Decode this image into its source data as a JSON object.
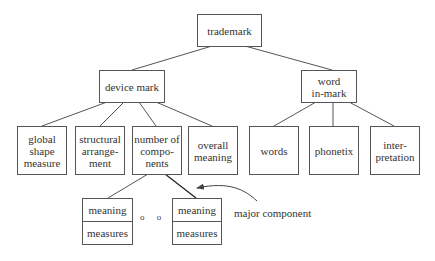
{
  "root": {
    "label": "trademark"
  },
  "level1": [
    {
      "label": "device mark"
    },
    {
      "label": "word\nin-mark"
    }
  ],
  "device_children": [
    {
      "label": "global\nshape\nmeasure"
    },
    {
      "label": "structural\narrange-\nment"
    },
    {
      "label": "number of\ncompo-\nnents"
    },
    {
      "label": "overall\nmeaning"
    }
  ],
  "word_children": [
    {
      "label": "words"
    },
    {
      "label": "phonetix"
    },
    {
      "label": "inter-\npretation"
    }
  ],
  "components": [
    {
      "top": "meaning",
      "bottom": "measures"
    },
    {
      "top": "meaning",
      "bottom": "measures"
    }
  ],
  "ellipsis": "o o o",
  "annotation": {
    "label": "major component"
  }
}
